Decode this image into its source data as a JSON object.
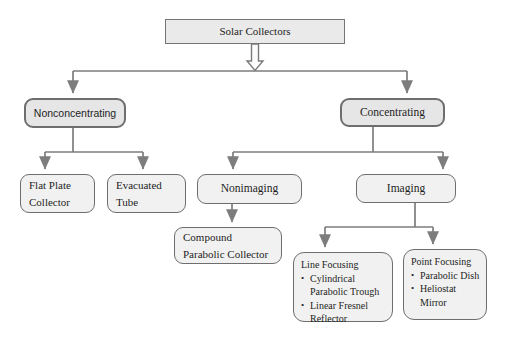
{
  "diagram": {
    "nodes": {
      "solar": {
        "label": "Solar Collectors"
      },
      "nonconcentrating": {
        "label": "Nonconcentrating"
      },
      "concentrating": {
        "label": "Concentrating"
      },
      "flat_plate": {
        "label": "Flat Plate Collector"
      },
      "evacuated_tube": {
        "label": "Evacuated Tube"
      },
      "nonimaging": {
        "label": "Nonimaging"
      },
      "imaging": {
        "label": "Imaging"
      },
      "compound_parabolic": {
        "label": "Compound Parabolic Collector"
      },
      "line_focusing": {
        "title": "Line Focusing",
        "bullets": [
          "Cylindrical Parabolic Trough",
          "Linear Fresnel Reflector"
        ]
      },
      "point_focusing": {
        "title": "Point Focusing",
        "bullets": [
          "Parabolic Dish",
          "Heliostat Mirror"
        ]
      }
    },
    "ui": {
      "bullet": "•"
    },
    "colors": {
      "connector_gray": "#7d7d7d",
      "box_border": "#6e6e6e",
      "tier_fill": "#e6e6e6",
      "leaf_fill": "#f1f1f1",
      "root_fill": "#eaeaea",
      "background": "#ffffff",
      "text": "#1e1e1e"
    }
  }
}
